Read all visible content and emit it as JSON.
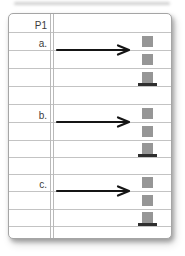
{
  "page_title": "P1",
  "items": [
    {
      "label": "a.",
      "arrow_icon": "right-arrow",
      "square_count": 3,
      "bottom_square_has_base": true
    },
    {
      "label": "b.",
      "arrow_icon": "right-arrow",
      "square_count": 3,
      "bottom_square_has_base": true
    },
    {
      "label": "c.",
      "arrow_icon": "right-arrow",
      "square_count": 3,
      "bottom_square_has_base": true
    }
  ],
  "colors": {
    "square": "#969696",
    "base_bar": "#2e2e2e",
    "arrow": "#151515",
    "ruled_line": "#c3c3c3",
    "margin_line": "#b9b9b9",
    "page_border": "#a5a5a5",
    "label_text": "#3c3c3c",
    "page_background": "#ffffff"
  }
}
